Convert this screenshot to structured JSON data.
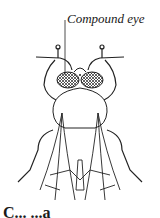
{
  "figure": {
    "labels": [
      {
        "text": "Compound eye",
        "target": "compound-eye"
      }
    ],
    "caption_partial": "C... ...a"
  },
  "colors": {
    "line": "#222222",
    "background": "#ffffff"
  }
}
